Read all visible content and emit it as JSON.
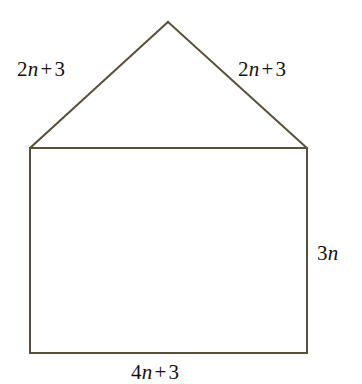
{
  "figure": {
    "name": "pentagon-house-shape",
    "stroke_color": "#5a5038",
    "stroke_width": 2,
    "background_color": "#ffffff",
    "text_color": "#17120f",
    "vertices": {
      "apex": [
        168,
        22
      ],
      "top_left": [
        30,
        148
      ],
      "top_right": [
        307,
        148
      ],
      "bottom_right": [
        307,
        353
      ],
      "bottom_left": [
        30,
        353
      ]
    },
    "labels": {
      "left_slant": {
        "coefficient": "2",
        "variable": "n",
        "operator": "+",
        "constant": "3",
        "text": "2n + 3"
      },
      "right_slant": {
        "coefficient": "2",
        "variable": "n",
        "operator": "+",
        "constant": "3",
        "text": "2n + 3"
      },
      "right_side": {
        "coefficient": "3",
        "variable": "n",
        "text": "3n"
      },
      "bottom_side": {
        "coefficient": "4",
        "variable": "n",
        "operator": "+",
        "constant": "3",
        "text": "4n + 3"
      }
    }
  }
}
